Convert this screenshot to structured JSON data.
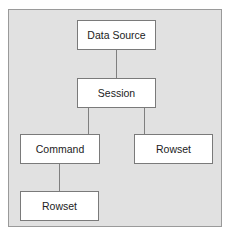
{
  "diagram": {
    "nodes": [
      {
        "id": "data-source",
        "label": "Data Source"
      },
      {
        "id": "session",
        "label": "Session"
      },
      {
        "id": "command",
        "label": "Command"
      },
      {
        "id": "rowset-session",
        "label": "Rowset"
      },
      {
        "id": "rowset-command",
        "label": "Rowset"
      }
    ],
    "edges": [
      {
        "from": "data-source",
        "to": "session"
      },
      {
        "from": "session",
        "to": "command"
      },
      {
        "from": "session",
        "to": "rowset-session"
      },
      {
        "from": "command",
        "to": "rowset-command"
      }
    ]
  }
}
